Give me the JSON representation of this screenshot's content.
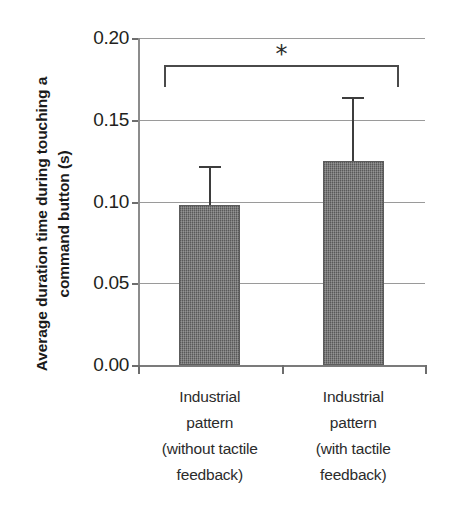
{
  "chart_data": {
    "type": "bar",
    "title": "",
    "xlabel": "",
    "ylabel": "Average duration time during touching a command button (s)",
    "categories": [
      "Industrial pattern (without tactile feedback)",
      "Industrial pattern (with tactile feedback)"
    ],
    "category_lines": [
      [
        "Industrial",
        "pattern",
        "(without tactile",
        "feedback)"
      ],
      [
        "Industrial",
        "pattern",
        "(with tactile",
        "feedback)"
      ]
    ],
    "values": [
      0.098,
      0.125
    ],
    "errors": [
      0.024,
      0.039
    ],
    "error_type": "upper-only",
    "ylim": [
      0.0,
      0.2
    ],
    "ytick_values": [
      0.0,
      0.05,
      0.1,
      0.15,
      0.2
    ],
    "ytick_labels": [
      "0.00",
      "0.05",
      "0.10",
      "0.15",
      "0.20"
    ],
    "ytick_interval": 0.05,
    "grid": true,
    "legend": false,
    "bar_color": "#6f6f6f",
    "annotations": [
      {
        "type": "significance-bracket",
        "label": "*",
        "from_category": 0,
        "to_category": 1,
        "y": 0.1835
      }
    ]
  }
}
